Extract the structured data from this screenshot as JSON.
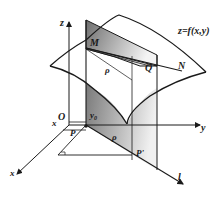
{
  "figure": {
    "labels": {
      "z_axis": "z",
      "y_axis": "y",
      "x_axis": "x",
      "x_small": "x",
      "origin": "O",
      "y0": "y",
      "y0_sub": "0",
      "surface": "z=f(x,y)",
      "point_M": "M",
      "point_N": "N",
      "point_Q": "Q",
      "rho_upper": "ρ",
      "rho_lower": "ρ",
      "point_P": "P",
      "point_P_prime": "P'",
      "line_l": "l"
    },
    "colors": {
      "stroke": "#1a1a1a",
      "plane_dark": "#7a7a7a",
      "plane_light": "#f2f2f2"
    }
  }
}
